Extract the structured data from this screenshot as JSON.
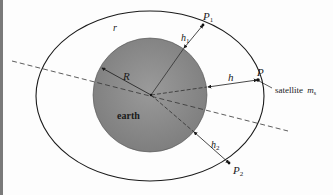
{
  "diagram": {
    "type": "orbit-geometry",
    "labels": {
      "orbit": "r",
      "earth": "earth",
      "radius": "R",
      "point_p": "P",
      "point_p1": "P",
      "point_p1_sub": "1",
      "point_p2": "P",
      "point_p2_sub": "2",
      "height_h": "h",
      "height_h1": "h",
      "height_h1_sub": "1",
      "height_h2": "h",
      "height_h2_sub": "2",
      "satellite": "satellite",
      "satellite_mass": "m",
      "satellite_mass_sub": "s"
    },
    "colors": {
      "earth_fill": "#8a8a8a",
      "line": "#1a1a1a",
      "background": "#fdfdfd"
    }
  }
}
